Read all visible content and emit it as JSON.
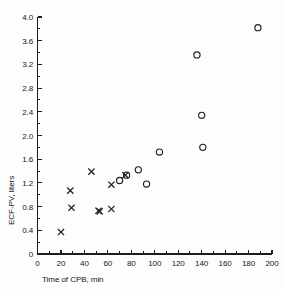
{
  "chart_data": {
    "type": "scatter",
    "title": "",
    "subtitle": "",
    "xlabel": "Time of CPB, min",
    "ylabel": "ECF-PV, liters",
    "xlim": [
      0,
      200
    ],
    "ylim": [
      0,
      4.0
    ],
    "x_ticks": [
      0,
      20,
      40,
      60,
      80,
      100,
      120,
      140,
      160,
      180,
      200
    ],
    "x_tick_labels": [
      "0",
      "20",
      "40",
      "60",
      "80",
      "100",
      "120",
      "140",
      "160",
      "180",
      "200"
    ],
    "x_minor_step": 10,
    "y_ticks": [
      0,
      0.4,
      0.8,
      1.2,
      1.6,
      2.0,
      2.4,
      2.8,
      3.2,
      3.6,
      4.0
    ],
    "y_tick_labels": [
      "0",
      "0.4",
      "0.8",
      "1.2",
      "1.6",
      "2.0",
      "2.4",
      "2.8",
      "3.2",
      "3.6",
      "4.0"
    ],
    "y_minor_step": 0.2,
    "grid": false,
    "legend": null,
    "legend_position": "none",
    "marker_color": "#202020",
    "axis_color": "#1d1d1d",
    "background_color": "#fdfdfd",
    "series": [
      {
        "name": "cross-series",
        "marker": "cross",
        "points": [
          {
            "x": 20,
            "y": 0.37
          },
          {
            "x": 28,
            "y": 1.07
          },
          {
            "x": 29,
            "y": 0.78
          },
          {
            "x": 46,
            "y": 1.39
          },
          {
            "x": 52,
            "y": 0.73
          },
          {
            "x": 53,
            "y": 0.72
          },
          {
            "x": 63,
            "y": 0.76
          },
          {
            "x": 63,
            "y": 1.17
          },
          {
            "x": 75,
            "y": 1.33
          }
        ]
      },
      {
        "name": "circle-series",
        "marker": "circle",
        "points": [
          {
            "x": 70,
            "y": 1.24
          },
          {
            "x": 76,
            "y": 1.33
          },
          {
            "x": 86,
            "y": 1.42
          },
          {
            "x": 93,
            "y": 1.18
          },
          {
            "x": 104,
            "y": 1.72
          },
          {
            "x": 136,
            "y": 3.36
          },
          {
            "x": 140,
            "y": 2.34
          },
          {
            "x": 141,
            "y": 1.8
          },
          {
            "x": 188,
            "y": 3.82
          }
        ]
      }
    ]
  },
  "figure": {
    "name": "scatter-plot-ecf-pv-vs-cpb-time"
  }
}
